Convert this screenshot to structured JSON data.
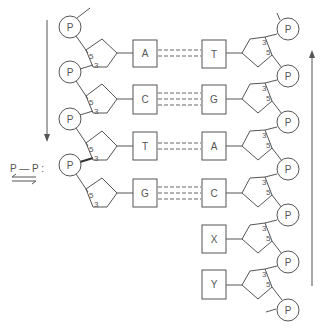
{
  "diagram": {
    "phosphate_label": "P",
    "left_strand": {
      "bases": [
        "A",
        "C",
        "T",
        "G"
      ],
      "sugar_labels": {
        "five_prime": "5",
        "three_prime": "3"
      },
      "direction_arrow": "down"
    },
    "right_strand": {
      "bases": [
        "T",
        "G",
        "A",
        "C",
        "X",
        "Y"
      ],
      "sugar_labels": {
        "three_prime": "3",
        "five_prime": "5"
      },
      "direction_arrow": "up"
    },
    "pairs": [
      {
        "left": "A",
        "right": "T",
        "bonds": 2
      },
      {
        "left": "C",
        "right": "G",
        "bonds": 3
      },
      {
        "left": "T",
        "right": "A",
        "bonds": 2
      },
      {
        "left": "G",
        "right": "C",
        "bonds": 3
      }
    ],
    "legend": {
      "text": "P — P :",
      "symbol": "equilibrium-arrows"
    }
  }
}
